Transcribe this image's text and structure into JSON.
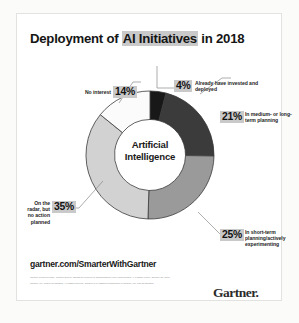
{
  "card": {
    "title_prefix": "Deployment of ",
    "title_highlight": "AI Initiatives",
    "title_suffix": " in 2018",
    "center_line1": "Artificial",
    "center_line2": "Intelligence",
    "url": "gartner.com/SmarterWithGartner",
    "logo": "Gartner",
    "logo_dot": ".",
    "fineprint": [
      "Gartner Press Release, 'Gartner Survey Shows 37 Percent of Organizations Have Implemented AI in Some Form,' January 21, 2019.",
      "Gartner, Inc. and/or its affiliates. All rights reserved. Gartner is a registered trademark of Gartner, Inc. and its affiliates."
    ]
  },
  "chart_data": {
    "type": "pie",
    "title": "Deployment of AI Initiatives in 2018",
    "center_label": "Artificial Intelligence",
    "donut": true,
    "hole_ratio": 0.555,
    "start_angle_deg": 0,
    "direction": "clockwise",
    "grid": false,
    "legend_position": "callouts",
    "units": "percent",
    "total": 99,
    "categories": [
      "Already have invested and deployed",
      "In medium- or long-term planning",
      "In short-term planning/actively experimenting",
      "On the radar, but no action planned",
      "No interest"
    ],
    "values": [
      4,
      21,
      25,
      35,
      14
    ],
    "labels": [
      "4%",
      "21%",
      "25%",
      "35%",
      "14%"
    ],
    "colors": [
      "#181818",
      "#3b3b3b",
      "#9a9a9a",
      "#d2d2d2",
      "#fbfbfb"
    ],
    "slices": [
      {
        "label": "4%",
        "value": 4,
        "description": "Already have invested and deployed",
        "color": "#181818"
      },
      {
        "label": "21%",
        "value": 21,
        "description": "In medium- or long-term planning",
        "color": "#3b3b3b"
      },
      {
        "label": "25%",
        "value": 25,
        "description": "In short-term planning/actively experimenting",
        "color": "#9a9a9a"
      },
      {
        "label": "35%",
        "value": 35,
        "description": "On the radar, but no action planned",
        "color": "#d2d2d2"
      },
      {
        "label": "14%",
        "value": 14,
        "description": "No interest",
        "color": "#fbfbfb"
      }
    ]
  }
}
